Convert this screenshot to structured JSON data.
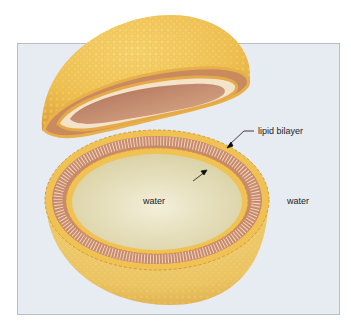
{
  "figure": {
    "labels": {
      "bilayer": "lipid bilayer",
      "inner_water": "water",
      "outer_water": "water"
    },
    "colors": {
      "background_panel": "#e6ecf2",
      "panel_border": "#b9bec4",
      "headgroup": "#f2c14e",
      "shell_outer": "#efc356",
      "tail_region": "#c9896a",
      "inner_cavity": "#ece6c4",
      "upper_cavity": "#c99478"
    }
  }
}
